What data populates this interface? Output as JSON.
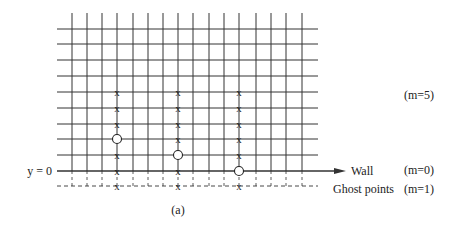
{
  "diagram": {
    "caption": "(a)",
    "axis_label": "y = 0",
    "wall_label": "Wall",
    "ghost_label": "Ghost points",
    "annotations": {
      "m5": "(m=5)",
      "m0": "(m=0)",
      "m1": "(m=1)"
    },
    "grid": {
      "x_lines": [
        72,
        87,
        102,
        117,
        133,
        148,
        163,
        178,
        193,
        209,
        224,
        239,
        256,
        271,
        286,
        302
      ],
      "y_lines": [
        29,
        44,
        60,
        76,
        92,
        108,
        124,
        139,
        155
      ],
      "wall_y": 171,
      "ghost_y": 186,
      "left": 57,
      "right": 318,
      "top": 13
    },
    "columns": [
      {
        "x": 117,
        "crosses": [
          92,
          108,
          124,
          155,
          171,
          186
        ],
        "circle": 139
      },
      {
        "x": 178,
        "crosses": [
          92,
          108,
          124,
          139,
          171,
          186
        ],
        "circle": 155
      },
      {
        "x": 239,
        "crosses": [
          92,
          108,
          124,
          139,
          155,
          186
        ],
        "circle": 171
      }
    ],
    "colors": {
      "line": "#333333",
      "text": "#222222"
    }
  }
}
